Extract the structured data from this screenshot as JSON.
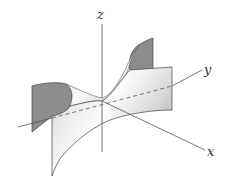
{
  "figure": {
    "axes": {
      "x_label": "x",
      "y_label": "y",
      "z_label": "z"
    },
    "colors": {
      "background": "#ffffff",
      "surface_light": "#f4f4f4",
      "surface_mid": "#c8c8c8",
      "surface_dark": "#8a8a8a",
      "cross_section": "#8c8c8c",
      "axis": "#555555",
      "edge": "#444444"
    }
  }
}
